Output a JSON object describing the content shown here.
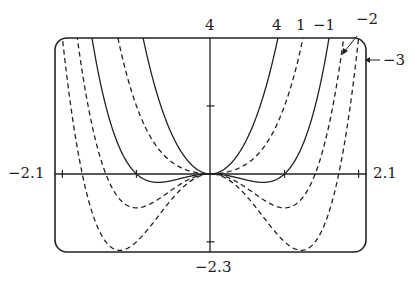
{
  "chart_data": {
    "type": "line",
    "title": "",
    "function_family": "y = x^4 + c x^2",
    "xlim": [
      -2.1,
      2.1
    ],
    "ylim": [
      -2.3,
      4
    ],
    "x_tick_labels": {
      "left": "−2.1",
      "right": "2.1"
    },
    "y_tick_labels": {
      "top": "4",
      "bottom": "−2.3"
    },
    "series": [
      {
        "name": "4",
        "c": 4,
        "style": "solid"
      },
      {
        "name": "1",
        "c": 1,
        "style": "dashed"
      },
      {
        "name": "−1",
        "c": -1,
        "style": "solid"
      },
      {
        "name": "−2",
        "c": -2,
        "style": "dashed"
      },
      {
        "name": "−3",
        "c": -3,
        "style": "dashed"
      }
    ],
    "grid": false
  },
  "labels": {
    "ymax": "4",
    "ymin": "−2.3",
    "xmin": "−2.1",
    "xmax": "2.1",
    "c4": "4",
    "c1": "1",
    "cm1": "−1",
    "cm2": "−2",
    "cm3": "−3"
  }
}
